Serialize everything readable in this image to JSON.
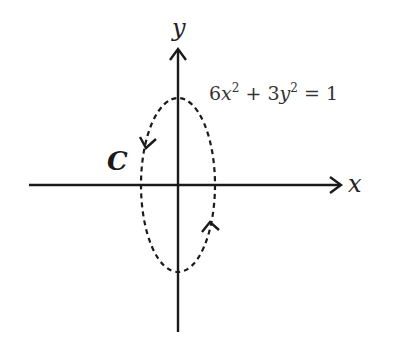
{
  "diagram": {
    "type": "ellipse-contour-on-axes",
    "labels": {
      "x_axis": "x",
      "y_axis": "y",
      "curve": "C"
    },
    "equation": {
      "coef_x": "6",
      "var_x": "x",
      "exp_x": "2",
      "op": " + ",
      "coef_y": "3",
      "var_y": "y",
      "exp_y": "2",
      "rhs": " = 1",
      "full": "6x^2 + 3y^2 = 1"
    },
    "curve_style": "dashed",
    "orientation": "counterclockwise",
    "colors": {
      "stroke": "#1a1a1a",
      "background": "#ffffff"
    }
  }
}
